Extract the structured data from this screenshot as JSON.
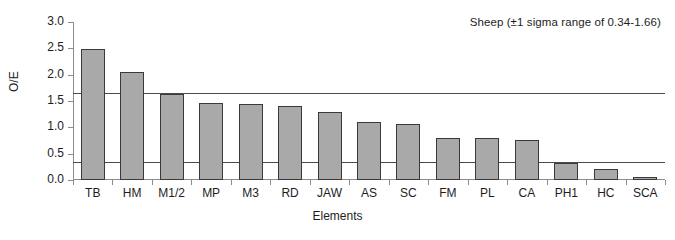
{
  "chart_data": {
    "type": "bar",
    "title": "",
    "annotation": "Sheep (±1 sigma range of 0.34-1.66)",
    "xlabel": "Elements",
    "ylabel": "O/E",
    "categories": [
      "TB",
      "HM",
      "M1/2",
      "MP",
      "M3",
      "RD",
      "JAW",
      "AS",
      "SC",
      "FM",
      "PL",
      "CA",
      "PH1",
      "HC",
      "SCA"
    ],
    "values": [
      2.48,
      2.06,
      1.64,
      1.46,
      1.44,
      1.4,
      1.3,
      1.11,
      1.07,
      0.8,
      0.79,
      0.76,
      0.32,
      0.2,
      0.06
    ],
    "ylim": [
      0.0,
      3.0
    ],
    "ytick_labels": [
      "3.0",
      "2.5",
      "2.0",
      "1.5",
      "1.0",
      "0.5",
      "0.0"
    ],
    "ytick_values": [
      3.0,
      2.5,
      2.0,
      1.5,
      1.0,
      0.5,
      0.0
    ],
    "reference_lines": [
      {
        "name": "upper-sigma-line",
        "value": 1.66
      },
      {
        "name": "lower-sigma-line",
        "value": 0.34
      }
    ],
    "grid": false,
    "legend": "none",
    "bar_fill_color": "#a9a9a9",
    "bar_border_color": "#3a3a3a",
    "axis_color": "#8c8c8c",
    "reference_line_color": "#4a4a4a"
  }
}
